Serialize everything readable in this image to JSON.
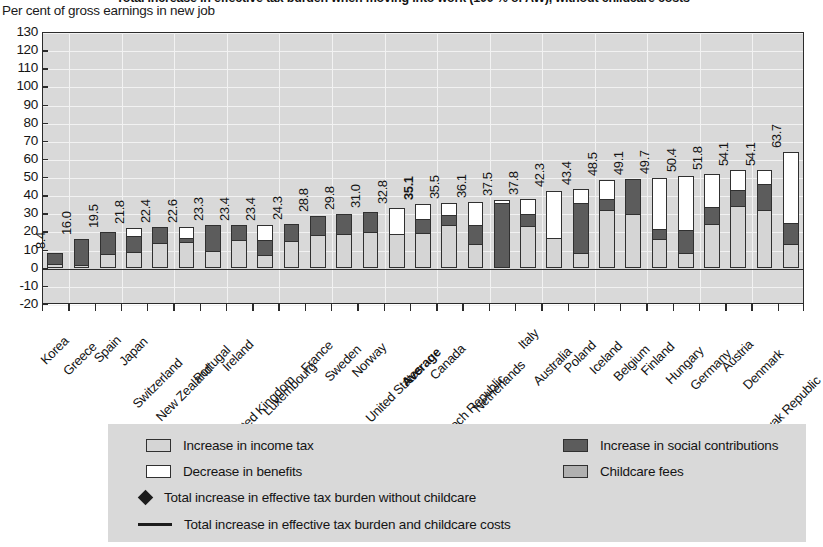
{
  "chart_data": {
    "type": "bar",
    "title": "Total increase in effective tax burden when moving into work (100 % of AW), without childcare costs",
    "subtitle": "Per cent of gross earnings in new job",
    "ylabel": "Per cent of gross earnings in new job",
    "xlabel": "",
    "ylim": [
      -20,
      130
    ],
    "yticks": [
      130,
      120,
      110,
      100,
      90,
      80,
      70,
      60,
      50,
      40,
      30,
      20,
      10,
      0,
      -10,
      -20
    ],
    "grid": true,
    "stacked": true,
    "legend_position": "bottom",
    "categories": [
      "Korea",
      "Greece",
      "Spain",
      "Japan",
      "Switzerland",
      "New Zealand",
      "Portugal",
      "Ireland",
      "United Kingdom",
      "Luxembourg",
      "France",
      "Sweden",
      "Norway",
      "United States",
      "Average",
      "Canada",
      "Czech Republic",
      "Netherlands",
      "Italy",
      "Australia",
      "Poland",
      "Iceland",
      "Belgium",
      "Finland",
      "Hungary",
      "Germany",
      "Austria",
      "Denmark",
      "Slovak Republic"
    ],
    "totals": [
      8.4,
      16.0,
      19.5,
      21.8,
      22.4,
      22.6,
      23.3,
      23.4,
      23.4,
      24.3,
      28.8,
      29.8,
      31.0,
      32.8,
      35.1,
      35.5,
      36.1,
      37.5,
      37.8,
      42.3,
      43.4,
      48.5,
      49.1,
      49.7,
      50.4,
      51.8,
      54.1,
      54.1,
      63.7
    ],
    "highlight_category": "Average",
    "series": [
      {
        "name": "Increase in income tax",
        "color": "#d5d5d5",
        "values": [
          2.0,
          1.0,
          7.5,
          8.5,
          14.0,
          14.5,
          9.0,
          15.5,
          6.5,
          15.0,
          18.0,
          19.0,
          20.0,
          18.5,
          19.0,
          23.5,
          13.0,
          0.0,
          23.0,
          16.5,
          8.0,
          32.0,
          29.5,
          15.5,
          8.0,
          24.0,
          34.0,
          32.0,
          12.5
        ]
      },
      {
        "name": "Increase in social contributions",
        "color": "#5c5c5c",
        "values": [
          6.4,
          15.0,
          12.0,
          9.5,
          8.4,
          2.0,
          14.3,
          7.9,
          9.0,
          9.3,
          10.8,
          10.8,
          11.0,
          0.0,
          8.0,
          6.0,
          11.0,
          36.0,
          7.0,
          0.0,
          28.0,
          6.5,
          19.6,
          5.5,
          12.5,
          9.8,
          9.0,
          14.6,
          12.2
        ]
      },
      {
        "name": "Decrease in benefits",
        "color": "#ffffff",
        "values": [
          0.0,
          0.0,
          0.0,
          3.8,
          0.0,
          6.1,
          0.0,
          0.0,
          7.9,
          0.0,
          0.0,
          0.0,
          0.0,
          14.3,
          8.1,
          6.0,
          12.1,
          1.5,
          7.8,
          25.8,
          7.4,
          10.0,
          0.0,
          28.7,
          29.9,
          18.0,
          11.1,
          7.5,
          39.0
        ]
      },
      {
        "name": "Childcare fees",
        "color": "#b0b0b0",
        "values": [
          0,
          0,
          0,
          0,
          0,
          0,
          0,
          0,
          0,
          0,
          0,
          0,
          0,
          0,
          0,
          0,
          0,
          0,
          0,
          0,
          0,
          0,
          0,
          0,
          0,
          0,
          0,
          0,
          0
        ]
      }
    ],
    "value_labels": [
      "8.4",
      "16.0",
      "19.5",
      "21.8",
      "22.4",
      "22.6",
      "23.3",
      "23.4",
      "23.4",
      "24.3",
      "28.8",
      "29.8",
      "31.0",
      "32.8",
      "35.1",
      "35.5",
      "36.1",
      "37.5",
      "37.8",
      "42.3",
      "43.4",
      "48.5",
      "49.1",
      "49.7",
      "50.4",
      "51.8",
      "54.1",
      "54.1",
      "63.7"
    ]
  },
  "legend": {
    "items": [
      {
        "marker": "square-light-gray",
        "label": "Increase in income tax"
      },
      {
        "marker": "square-dark-gray",
        "label": "Increase in social contributions"
      },
      {
        "marker": "square-white",
        "label": "Decrease in benefits"
      },
      {
        "marker": "square-mid-gray",
        "label": "Childcare fees"
      },
      {
        "marker": "diamond",
        "label": "Total increase in effective tax burden without childcare"
      },
      {
        "marker": "line",
        "label": "Total increase in effective tax burden and childcare costs"
      }
    ]
  }
}
